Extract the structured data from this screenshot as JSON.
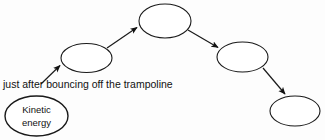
{
  "diagram": {
    "background_color": "#fdfdfd",
    "stroke_color": "#1a1a1a",
    "fill_color": "#ffffff",
    "caption": {
      "text": "just after bouncing off the trampoline",
      "x": 3,
      "y": 88
    },
    "nodes": [
      {
        "id": "kinetic-energy",
        "label_line1": "Kinetic",
        "label_line2": "energy",
        "cx": 36.5,
        "cy": 116,
        "rx": 31.5,
        "ry": 20
      },
      {
        "id": "node-2",
        "label_line1": "",
        "label_line2": "",
        "cx": 86.5,
        "cy": 58,
        "rx": 25.5,
        "ry": 14.5
      },
      {
        "id": "node-3",
        "label_line1": "",
        "label_line2": "",
        "cx": 165,
        "cy": 21,
        "rx": 26,
        "ry": 17
      },
      {
        "id": "node-4",
        "label_line1": "",
        "label_line2": "",
        "cx": 242.5,
        "cy": 57,
        "rx": 25.5,
        "ry": 15
      },
      {
        "id": "node-5",
        "label_line1": "",
        "label_line2": "",
        "cx": 295,
        "cy": 111,
        "rx": 25,
        "ry": 15
      }
    ],
    "arrows": [
      {
        "id": "arrow-1",
        "from": "kinetic-energy",
        "to": "node-2",
        "x1": 41,
        "y1": 84,
        "x2": 61,
        "y2": 65
      },
      {
        "id": "arrow-2",
        "from": "node-2",
        "to": "node-3",
        "x1": 107,
        "y1": 48,
        "x2": 138,
        "y2": 27
      },
      {
        "id": "arrow-3",
        "from": "node-3",
        "to": "node-4",
        "x1": 188,
        "y1": 30,
        "x2": 219,
        "y2": 48
      },
      {
        "id": "arrow-4",
        "from": "node-4",
        "to": "node-5",
        "x1": 263,
        "y1": 68,
        "x2": 286,
        "y2": 95
      }
    ]
  }
}
